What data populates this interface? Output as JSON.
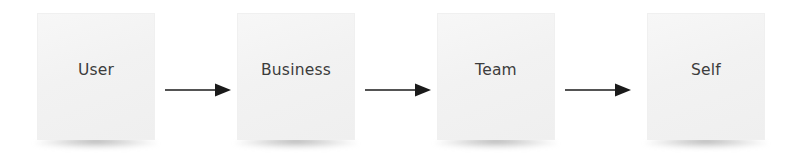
{
  "diagram": {
    "type": "linear-flow",
    "background_color": "#ffffff",
    "node_fill_color": "#f2f2f2",
    "label_color": "#3c3c3c",
    "arrow_color": "#1a1a1a",
    "nodes": [
      {
        "id": "user",
        "label": "User"
      },
      {
        "id": "business",
        "label": "Business"
      },
      {
        "id": "team",
        "label": "Team"
      },
      {
        "id": "self",
        "label": "Self"
      }
    ],
    "connectors": [
      {
        "id": "user-to-business",
        "icon": "arrow-right-icon",
        "from": "User",
        "to": "Business"
      },
      {
        "id": "business-to-team",
        "icon": "arrow-right-icon",
        "from": "Business",
        "to": "Team"
      },
      {
        "id": "team-to-self",
        "icon": "arrow-right-icon",
        "from": "Team",
        "to": "Self"
      }
    ]
  }
}
